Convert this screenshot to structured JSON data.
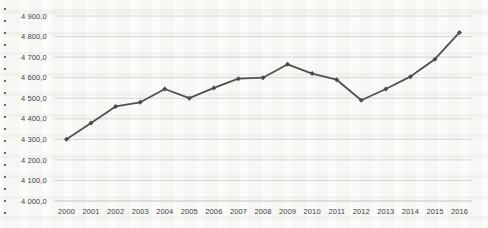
{
  "chart_data": {
    "type": "line",
    "title": "",
    "xlabel": "",
    "ylabel": "",
    "legend": "none",
    "grid": true,
    "categories": [
      "2000",
      "2001",
      "2002",
      "2003",
      "2004",
      "2005",
      "2006",
      "2007",
      "2008",
      "2009",
      "2010",
      "2011",
      "2012",
      "2013",
      "2014",
      "2015",
      "2016"
    ],
    "series": [
      {
        "name": "",
        "values": [
          4300,
          4380,
          4460,
          4480,
          4545,
          4500,
          4550,
          4595,
          4600,
          4665,
          4620,
          4590,
          4490,
          4545,
          4605,
          4690,
          4820
        ]
      }
    ],
    "ylim": [
      4000,
      4900
    ],
    "ytick_step": 100,
    "yticks": [
      {
        "value": 4900,
        "label": "4 900,0"
      },
      {
        "value": 4800,
        "label": "4 800,0"
      },
      {
        "value": 4700,
        "label": "4 700,0"
      },
      {
        "value": 4600,
        "label": "4 600,0"
      },
      {
        "value": 4500,
        "label": "4 500,0"
      },
      {
        "value": 4400,
        "label": "4 400,0"
      },
      {
        "value": 4300,
        "label": "4 300,0"
      },
      {
        "value": 4200,
        "label": "4 200,0"
      },
      {
        "value": 4100,
        "label": "4 100,0"
      },
      {
        "value": 4000,
        "label": "4 000,0"
      }
    ],
    "colors": {
      "line": "#4f4f4f",
      "marker": "#4a4a4a",
      "gridline": "#d7d7d3",
      "axis_line": "#c2c2bd",
      "tick_text": "#3d3d3d",
      "background": "#fbfbf9"
    },
    "marker_shape": "diamond"
  }
}
